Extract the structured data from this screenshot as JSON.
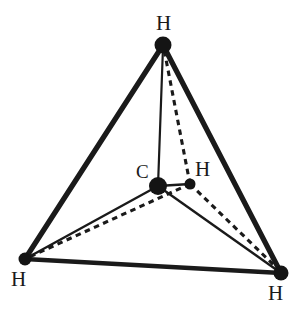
{
  "figure": {
    "molecule": "CH4",
    "background_color": "#ffffff",
    "ink_color": "#1a1a1a"
  },
  "labels": {
    "h_top": "H",
    "c_center": "C",
    "h_rear": "H",
    "h_bottom_left": "H",
    "h_bottom_right": "H"
  },
  "chart_data": {
    "type": "diagram",
    "atoms": [
      {
        "id": "h-top",
        "element": "H",
        "x": 163,
        "y": 45,
        "radius": 8.5,
        "label_x": 156,
        "label_y": 13
      },
      {
        "id": "c-center",
        "element": "C",
        "x": 158,
        "y": 186,
        "radius": 8.5,
        "label_x": 136,
        "label_y": 162
      },
      {
        "id": "h-rear",
        "element": "H",
        "x": 190,
        "y": 184,
        "radius": 5.5,
        "label_x": 195,
        "label_y": 159
      },
      {
        "id": "h-bottom-left",
        "element": "H",
        "x": 25,
        "y": 259,
        "radius": 6.5,
        "label_x": 11,
        "label_y": 269
      },
      {
        "id": "h-bottom-right",
        "element": "H",
        "x": 281,
        "y": 273,
        "radius": 7.5,
        "label_x": 268,
        "label_y": 283
      }
    ],
    "edges": [
      {
        "id": "edge-top-bl",
        "from": "h-top",
        "to": "h-bottom-left",
        "style": "solid",
        "weight": "thick"
      },
      {
        "id": "edge-top-br",
        "from": "h-top",
        "to": "h-bottom-right",
        "style": "solid",
        "weight": "thick"
      },
      {
        "id": "edge-bl-br",
        "from": "h-bottom-left",
        "to": "h-bottom-right",
        "style": "solid",
        "weight": "thick"
      }
    ],
    "bonds": [
      {
        "id": "bond-c-htop",
        "from": "c-center",
        "to": "h-top",
        "style": "solid"
      },
      {
        "id": "bond-c-hbl",
        "from": "c-center",
        "to": "h-bottom-left",
        "style": "solid"
      },
      {
        "id": "bond-c-hbr",
        "from": "c-center",
        "to": "h-bottom-right",
        "style": "solid"
      },
      {
        "id": "bond-c-hrear",
        "from": "c-center",
        "to": "h-rear",
        "style": "solid"
      },
      {
        "id": "dash-hrear-htop",
        "from": "h-rear",
        "to": "h-top",
        "style": "dashed"
      },
      {
        "id": "dash-hrear-hbl",
        "from": "h-rear",
        "to": "h-bottom-left",
        "style": "dashed"
      },
      {
        "id": "dash-hrear-hbr",
        "from": "h-rear",
        "to": "h-bottom-right",
        "style": "dashed"
      }
    ]
  }
}
